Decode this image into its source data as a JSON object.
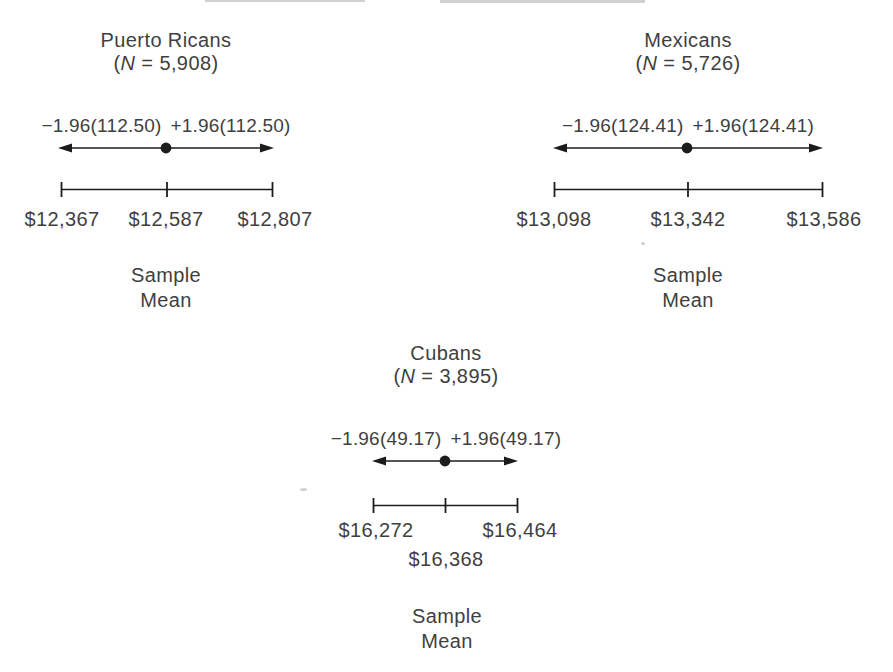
{
  "figure": {
    "caption_line1": "Sample",
    "caption_line2": "Mean",
    "colors": {
      "background": "#ffffff",
      "text": "#3f3f3f",
      "line": "#1c1c1c"
    },
    "panels": [
      {
        "group": "Puerto Ricans",
        "n_open": "(",
        "n_symbol": "N",
        "n_rest": " = 5,908)",
        "minus_term": "−1.96(112.50)",
        "plus_term": "+1.96(112.50)",
        "lower": "$12,367",
        "mean": "$12,587",
        "upper": "$12,807",
        "caption_line1": "Sample",
        "caption_line2": "Mean",
        "n_value": 5908,
        "standard_error": 112.5,
        "z_multiplier": 1.96,
        "lower_value": 12367,
        "mean_value": 12587,
        "upper_value": 12807
      },
      {
        "group": "Mexicans",
        "n_open": "(",
        "n_symbol": "N",
        "n_rest": " = 5,726)",
        "minus_term": "−1.96(124.41)",
        "plus_term": "+1.96(124.41)",
        "lower": "$13,098",
        "mean": "$13,342",
        "upper": "$13,586",
        "caption_line1": "Sample",
        "caption_line2": "Mean",
        "n_value": 5726,
        "standard_error": 124.41,
        "z_multiplier": 1.96,
        "lower_value": 13098,
        "mean_value": 13342,
        "upper_value": 13586
      },
      {
        "group": "Cubans",
        "n_open": "(",
        "n_symbol": "N",
        "n_rest": " = 3,895)",
        "minus_term": "−1.96(49.17)",
        "plus_term": "+1.96(49.17)",
        "lower": "$16,272",
        "mean": "$16,368",
        "upper": "$16,464",
        "caption_line1": "Sample",
        "caption_line2": "Mean",
        "n_value": 3895,
        "standard_error": 49.17,
        "z_multiplier": 1.96,
        "lower_value": 16272,
        "mean_value": 16368,
        "upper_value": 16464
      }
    ]
  }
}
